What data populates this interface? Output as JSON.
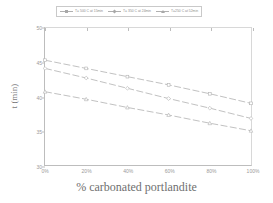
{
  "chart_data": {
    "type": "line",
    "title": "",
    "xlabel": "% carbonated portlandite",
    "ylabel": "t (min)",
    "xlim": [
      0,
      100
    ],
    "ylim": [
      30,
      50
    ],
    "grid": false,
    "legend_position": "top",
    "xticks": [
      "0%",
      "20%",
      "40%",
      "60%",
      "80%",
      "100%"
    ],
    "xtick_values": [
      0,
      20,
      40,
      60,
      80,
      100
    ],
    "yticks": [
      "30",
      "35",
      "40",
      "45",
      "50"
    ],
    "ytick_values": [
      30,
      35,
      40,
      45,
      50
    ],
    "x": [
      0,
      20,
      40,
      60,
      80,
      100
    ],
    "series": [
      {
        "name": "T= 500 C at 15min",
        "marker": "square",
        "color": "#b0b0b0",
        "values": [
          45.3,
          44.1,
          42.9,
          41.7,
          40.4,
          39.0
        ]
      },
      {
        "name": "T= 350 C at 24min",
        "marker": "diamond",
        "color": "#b0b0b0",
        "values": [
          44.1,
          42.7,
          41.2,
          39.7,
          38.3,
          36.8
        ]
      },
      {
        "name": "T=250 C at 52min",
        "marker": "triangle",
        "color": "#b0b0b0",
        "values": [
          40.7,
          39.6,
          38.4,
          37.3,
          36.1,
          35.0
        ]
      }
    ]
  },
  "colors": {
    "axis": "#bdbdbd",
    "frame": "#d8d8d8",
    "line": "#b0b0b0",
    "text": "#8d8d8d",
    "background": "#ffffff"
  }
}
